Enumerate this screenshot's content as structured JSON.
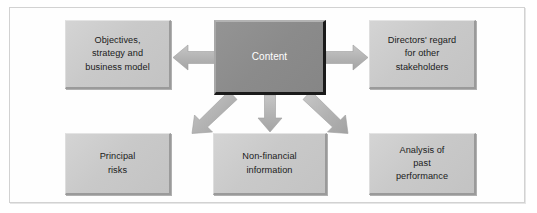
{
  "figure": {
    "title": "Content",
    "frame_color": "#d2d2d2",
    "background_color": "#ffffff"
  },
  "diagram": {
    "type": "hub-and-spoke",
    "center": {
      "id": "content",
      "label": "Content",
      "fill": "#8b8b8b",
      "text_color": "#ffffff"
    },
    "nodes": [
      {
        "id": "objectives-strategy-business-model",
        "label": "Objectives,\nstrategy and\nbusiness model",
        "position": "top-left",
        "fill": "#c9c9c9",
        "text_color": "#1b1b1b"
      },
      {
        "id": "directors-regard-other-stakeholders",
        "label": "Directors' regard\nfor other\nstakeholders",
        "position": "top-right",
        "fill": "#c9c9c9",
        "text_color": "#1b1b1b"
      },
      {
        "id": "principal-risks",
        "label": "Principal\nrisks",
        "position": "bottom-left",
        "fill": "#c9c9c9",
        "text_color": "#1b1b1b"
      },
      {
        "id": "non-financial-information",
        "label": "Non-financial\ninformation",
        "position": "bottom-center",
        "fill": "#c9c9c9",
        "text_color": "#1b1b1b"
      },
      {
        "id": "analysis-of-past-performance",
        "label": "Analysis of\npast\nperformance",
        "position": "bottom-right",
        "fill": "#c9c9c9",
        "text_color": "#1b1b1b"
      }
    ],
    "arrows": [
      {
        "id": "arrow-to-objectives",
        "from": "content",
        "to": "objectives-strategy-business-model",
        "direction": "left",
        "fill": "#b5b5b5"
      },
      {
        "id": "arrow-to-directors",
        "from": "content",
        "to": "directors-regard-other-stakeholders",
        "direction": "right",
        "fill": "#b5b5b5"
      },
      {
        "id": "arrow-to-principal-risks",
        "from": "content",
        "to": "principal-risks",
        "direction": "down-left",
        "fill": "#b5b5b5"
      },
      {
        "id": "arrow-to-non-financial",
        "from": "content",
        "to": "non-financial-information",
        "direction": "down",
        "fill": "#b5b5b5"
      },
      {
        "id": "arrow-to-past-performance",
        "from": "content",
        "to": "analysis-of-past-performance",
        "direction": "down-right",
        "fill": "#b5b5b5"
      }
    ]
  }
}
